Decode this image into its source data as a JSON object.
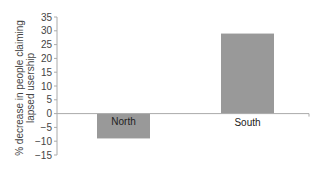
{
  "chart_data": {
    "type": "bar",
    "title": "",
    "xlabel": "",
    "ylabel_lines": [
      "% decrease in people claiming",
      "lapsed usership"
    ],
    "ylabel": "% decrease in people claiming lapsed usership",
    "categories": [
      "North",
      "South"
    ],
    "values": [
      -9,
      29
    ],
    "ylim": [
      -15,
      35
    ],
    "yticks": [
      35,
      30,
      25,
      20,
      15,
      10,
      5,
      0,
      -5,
      -10,
      -15
    ],
    "ytick_labels": [
      "35",
      "30",
      "25",
      "20",
      "15",
      "10",
      "5",
      "0",
      "−5",
      "−10",
      "−15"
    ],
    "grid": false,
    "legend": null,
    "bar_color": "#999999",
    "axis_color": "#aaaaaa"
  }
}
